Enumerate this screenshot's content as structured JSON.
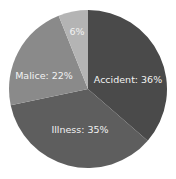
{
  "chart_data": {
    "type": "pie",
    "title": "",
    "categories": [
      "Accident",
      "Illness",
      "Malice",
      ""
    ],
    "values": [
      36,
      35,
      22,
      6
    ],
    "labels": [
      "Accident: 36%",
      "Illness: 35%",
      "Malice: 22%",
      "6%"
    ],
    "colors": [
      "#4a4a4a",
      "#5e5e5e",
      "#8a8a8a",
      "#b4b4b4"
    ],
    "start_angle_deg": 0,
    "direction": "clockwise",
    "legend": "none",
    "data_labels": "inside"
  }
}
